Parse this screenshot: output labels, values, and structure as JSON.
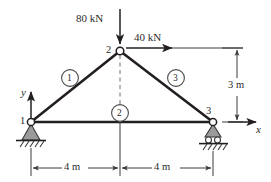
{
  "figure": {
    "kind": "statics-truss-free-body-diagram",
    "title": "",
    "colors": {
      "line": "#231f20",
      "member": "#231f20",
      "support_fill": "#9a9a9a",
      "support_stroke": "#3a3a3a",
      "joint_fill": "#ffffff",
      "dim_line": "#3a3a3a",
      "dashed": "#6e6e6e",
      "background": "#ffffff"
    }
  },
  "loads": [
    {
      "id": "load-80",
      "label": "80 kN",
      "magnitude": 80,
      "unit": "kN",
      "direction": "down",
      "applied_at_joint": "2"
    },
    {
      "id": "load-40",
      "label": "40 kN",
      "magnitude": 40,
      "unit": "kN",
      "direction": "right",
      "applied_at_joint": "2"
    }
  ],
  "joints": [
    {
      "id": "j1",
      "label": "1",
      "support": "pin",
      "x_m": 0,
      "y_m": 0
    },
    {
      "id": "j2",
      "label": "2",
      "support": "none",
      "x_m": 4,
      "y_m": 3
    },
    {
      "id": "j3",
      "label": "3",
      "support": "roller",
      "x_m": 8,
      "y_m": 0
    }
  ],
  "members": [
    {
      "id": "m1",
      "label": "1",
      "from": "1",
      "to": "2"
    },
    {
      "id": "m2",
      "label": "2",
      "from": "1",
      "to": "3"
    },
    {
      "id": "m3",
      "label": "3",
      "from": "2",
      "to": "3"
    }
  ],
  "dimensions": [
    {
      "id": "dim-left",
      "label": "4 m",
      "value": 4,
      "unit": "m",
      "orientation": "horizontal"
    },
    {
      "id": "dim-right",
      "label": "4 m",
      "value": 4,
      "unit": "m",
      "orientation": "horizontal"
    },
    {
      "id": "dim-height",
      "label": "3 m",
      "value": 3,
      "unit": "m",
      "orientation": "vertical"
    }
  ],
  "axes": {
    "x_label": "x",
    "y_label": "y",
    "origin_joint": "1"
  }
}
